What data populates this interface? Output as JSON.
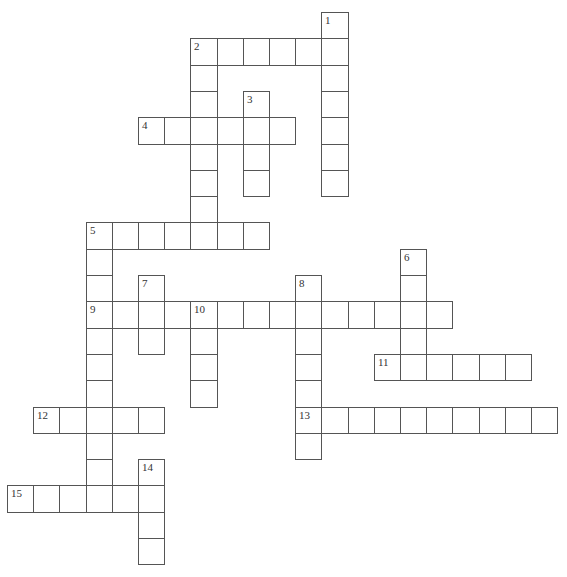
{
  "puzzle": {
    "type": "crossword",
    "layout": {
      "origin_x": 7,
      "origin_y": 12,
      "cell_w": 26.2,
      "cell_h": 26.3
    },
    "colors": {
      "background": "#ffffff",
      "border": "#555555",
      "number": "#333333"
    },
    "words": [
      {
        "number": "1",
        "direction": "down",
        "row": 0,
        "col": 12,
        "length": 7
      },
      {
        "number": "2",
        "direction": "across",
        "row": 1,
        "col": 7,
        "length": 6
      },
      {
        "number": "2",
        "direction": "down",
        "row": 1,
        "col": 7,
        "length": 8
      },
      {
        "number": "3",
        "direction": "down",
        "row": 3,
        "col": 9,
        "length": 4
      },
      {
        "number": "4",
        "direction": "across",
        "row": 4,
        "col": 5,
        "length": 6
      },
      {
        "number": "5",
        "direction": "across",
        "row": 8,
        "col": 3,
        "length": 7
      },
      {
        "number": "5",
        "direction": "down",
        "row": 8,
        "col": 3,
        "length": 11
      },
      {
        "number": "6",
        "direction": "down",
        "row": 9,
        "col": 15,
        "length": 5
      },
      {
        "number": "7",
        "direction": "down",
        "row": 10,
        "col": 5,
        "length": 3
      },
      {
        "number": "8",
        "direction": "down",
        "row": 10,
        "col": 11,
        "length": 7
      },
      {
        "number": "9",
        "direction": "across",
        "row": 11,
        "col": 3,
        "length": 14
      },
      {
        "number": "10",
        "direction": "down",
        "row": 11,
        "col": 7,
        "length": 4
      },
      {
        "number": "11",
        "direction": "across",
        "row": 13,
        "col": 14,
        "length": 6
      },
      {
        "number": "12",
        "direction": "across",
        "row": 15,
        "col": 1,
        "length": 5
      },
      {
        "number": "13",
        "direction": "across",
        "row": 15,
        "col": 11,
        "length": 10
      },
      {
        "number": "14",
        "direction": "down",
        "row": 17,
        "col": 5,
        "length": 4
      },
      {
        "number": "15",
        "direction": "across",
        "row": 18,
        "col": 0,
        "length": 6
      }
    ]
  }
}
